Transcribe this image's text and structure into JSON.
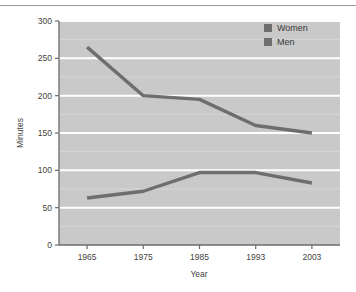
{
  "chart_data": {
    "type": "line",
    "title": "",
    "xlabel": "Year",
    "ylabel": "Minutes",
    "categories": [
      "1965",
      "1975",
      "1985",
      "1993",
      "2003"
    ],
    "series": [
      {
        "name": "Women",
        "values": [
          265,
          200,
          195,
          160,
          150
        ],
        "color": "#6e6e6e"
      },
      {
        "name": "Men",
        "values": [
          63,
          72,
          97,
          97,
          83
        ],
        "color": "#6e6e6e"
      }
    ],
    "ylim": [
      0,
      300
    ],
    "yticks": [
      "0",
      "50",
      "100",
      "150",
      "200",
      "250",
      "300"
    ],
    "ytick_values": [
      0,
      50,
      100,
      150,
      200,
      250,
      300
    ],
    "minor_yticks": [
      25,
      75,
      125,
      175,
      225,
      275
    ],
    "grid": "horizontal-white",
    "plot_background": "#c9c9c9",
    "legend_position": "top-right",
    "legend": [
      "Women",
      "Men"
    ]
  },
  "figure": {
    "axis_color": "#6b6b6b",
    "gridline_color": "#ffffff",
    "line_color": "#6e6e6e",
    "legend_swatch_color": "#6e6e6e",
    "top_rule_color": "#9a9a9a"
  }
}
